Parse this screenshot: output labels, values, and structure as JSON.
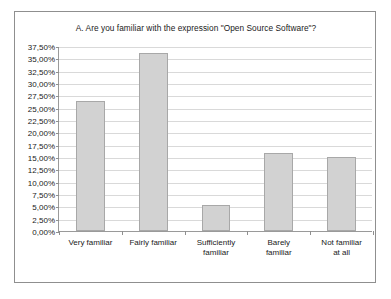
{
  "chart_data": {
    "type": "bar",
    "title": "A. Are you familiar with the expression \"Open Source Software\"?",
    "xlabel": "",
    "ylabel": "",
    "categories": [
      "Very familiar",
      "Fairly familiar",
      "Sufficiently\nfamiliar",
      "Barely\nfamiliar",
      "Not familiar\nat all"
    ],
    "values": [
      26.3,
      36.0,
      5.3,
      15.8,
      15.0
    ],
    "value_labels": [
      "26,30%",
      "36,00%",
      "5,30%",
      "15,80%",
      "15,00%"
    ],
    "ylim": [
      0,
      37.5
    ],
    "ytick_values": [
      0,
      2.5,
      5,
      7.5,
      10,
      12.5,
      15,
      17.5,
      20,
      22.5,
      25,
      27.5,
      30,
      32.5,
      35,
      37.5
    ],
    "ytick_labels": [
      "0,00%",
      "2,50%",
      "5,00%",
      "7,50%",
      "10,00%",
      "12,50%",
      "15,00%",
      "17,50%",
      "20,00%",
      "22,50%",
      "25,00%",
      "27,50%",
      "30,00%",
      "32,50%",
      "35,00%",
      "37,50%"
    ],
    "grid": true,
    "legend": null,
    "bar_color": "#d2d2d2",
    "bar_border_color": "#a8a8a8",
    "grid_color": "#d9d9d9",
    "axis_color": "#9a9a9a",
    "text_color": "#1a1a1a"
  }
}
